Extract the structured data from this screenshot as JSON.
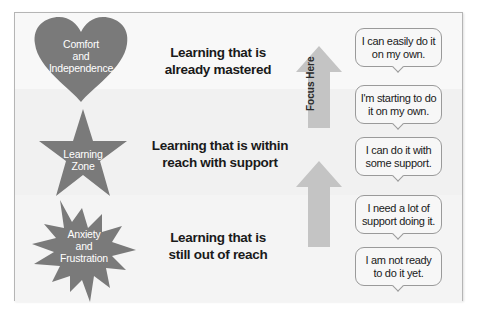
{
  "colors": {
    "shape_fill": "#7a7a7a",
    "arrow_fill": "#c4c4c4",
    "frame_border": "#b5b5b5",
    "bubble_border": "#9a9a9a"
  },
  "zones": [
    {
      "shape": "heart",
      "shape_label": [
        "Comfort",
        "and",
        "Independence"
      ],
      "description": [
        "Learning that is",
        "already mastered"
      ]
    },
    {
      "shape": "star",
      "shape_label": [
        "Learning",
        "Zone"
      ],
      "description": [
        "Learning that is within",
        "reach with support"
      ]
    },
    {
      "shape": "starburst",
      "shape_label": [
        "Anxiety",
        "and",
        "Frustration"
      ],
      "description": [
        "Learning that is",
        "still out of reach"
      ]
    }
  ],
  "arrows": {
    "upper_label": "Focus Here"
  },
  "bubbles": [
    [
      "I can easily do it",
      "on my own."
    ],
    [
      "I'm starting to do",
      "it on my own."
    ],
    [
      "I can do it with",
      "some support."
    ],
    [
      "I need a lot of",
      "support doing it."
    ],
    [
      "I am not ready",
      "to do it yet."
    ]
  ]
}
